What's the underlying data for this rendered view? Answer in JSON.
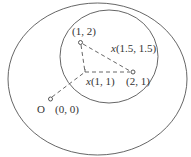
{
  "diagram": {
    "origin_label": "O",
    "points": {
      "p00": "(0, 0)",
      "p12": "(1, 2)",
      "p21": "(2, 1)",
      "x11_var": "x",
      "x11_coord": "(1, 1)",
      "x1515_var": "x",
      "x1515_coord": "(1.5, 1.5)"
    },
    "colors": {
      "stroke": "#555555",
      "text": "#333333"
    }
  }
}
